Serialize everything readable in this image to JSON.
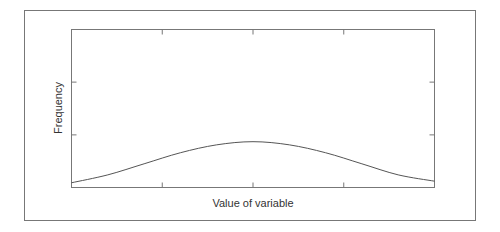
{
  "chart_data": {
    "type": "line",
    "title": "",
    "xlabel": "Value of variable",
    "ylabel": "Frequency",
    "x_ticks": [
      0.25,
      0.5,
      0.75
    ],
    "y_ticks": [
      0.333,
      0.667
    ],
    "xlim": [
      0,
      1
    ],
    "ylim": [
      0,
      1
    ],
    "grid": false,
    "legend": null,
    "series": [
      {
        "name": "distribution",
        "x": [
          0,
          0.1,
          0.2,
          0.3,
          0.4,
          0.5,
          0.6,
          0.7,
          0.8,
          0.9,
          1.0
        ],
        "values": [
          0.03,
          0.08,
          0.15,
          0.22,
          0.27,
          0.29,
          0.27,
          0.22,
          0.15,
          0.08,
          0.04
        ]
      }
    ],
    "style": {
      "line_color": "#555555",
      "frame_color": "#777777"
    }
  }
}
